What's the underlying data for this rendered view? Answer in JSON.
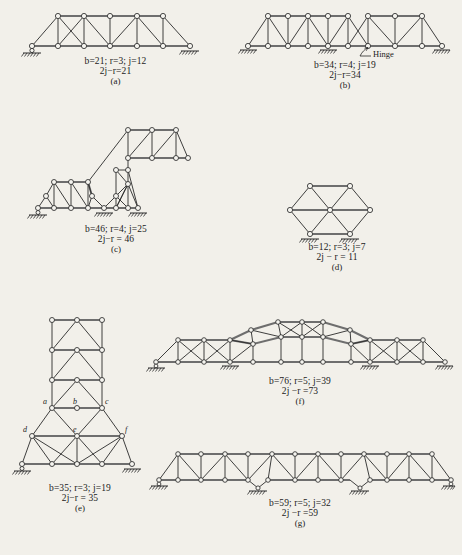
{
  "figure": {
    "type": "truss-determinacy-plate",
    "background": "#f2f0ea",
    "ink": "#2a2a2a"
  },
  "panels": [
    {
      "id": "a",
      "label": "(a)",
      "line1": "b=21;   r=3;   j=12",
      "line2": "2j−r=21",
      "b": 21,
      "r": 3,
      "j": 12,
      "result": 21,
      "supports": [
        "roller",
        "roller"
      ],
      "notes": ""
    },
    {
      "id": "b",
      "label": "(b)",
      "line1": "b=34;   r=4;   j=19",
      "line2": "2j−r=34",
      "b": 34,
      "r": 4,
      "j": 19,
      "result": 34,
      "supports": [
        "roller",
        "hatched",
        "roller"
      ],
      "annotation": "Hinge"
    },
    {
      "id": "c",
      "label": "(c)",
      "line1": "b=46;    r=4;    j=25",
      "line2": "2j−r = 46",
      "b": 46,
      "r": 4,
      "j": 25,
      "result": 46,
      "supports": [
        "hatched",
        "hatched",
        "hatched"
      ],
      "notes": ""
    },
    {
      "id": "d",
      "label": "(d)",
      "line1": "b=12;   r=3;   j=7",
      "line2": "2j − r = 11",
      "b": 12,
      "r": 3,
      "j": 7,
      "result": 11,
      "supports": [
        "hatched",
        "hatched"
      ],
      "notes": ""
    },
    {
      "id": "e",
      "label": "(e)",
      "line1": "b=35;   r=3;   j=19",
      "line2": "2j−r = 35",
      "b": 35,
      "r": 3,
      "j": 19,
      "result": 35,
      "supports": [
        "roller",
        "roller"
      ],
      "joint_labels": [
        "a",
        "b",
        "c",
        "d",
        "e",
        "f"
      ]
    },
    {
      "id": "f",
      "label": "(f)",
      "line1": "b=76;  r=5;  j=39",
      "line2": "2j −r =73",
      "b": 76,
      "r": 5,
      "j": 39,
      "result": 73,
      "supports": [
        "roller",
        "hatched",
        "hatched",
        "hatched"
      ],
      "notes": ""
    },
    {
      "id": "g",
      "label": "(g)",
      "line1": "b=59;  r=5;  j=32",
      "line2": "2j −r =59",
      "b": 59,
      "r": 5,
      "j": 32,
      "result": 59,
      "supports": [
        "roller",
        "rocker",
        "rocker",
        "roller"
      ],
      "notes": ""
    }
  ]
}
